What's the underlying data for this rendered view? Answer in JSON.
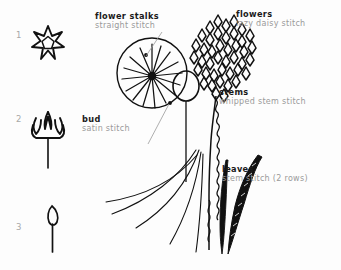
{
  "canvas": {
    "width": 341,
    "height": 270,
    "background": "#fdfdfd",
    "ink": "#111111",
    "heading_color": "#1a1a1a",
    "sub_color": "#9a9a9a",
    "number_color": "#a8a8a8"
  },
  "title": "",
  "steps": [
    {
      "number": "1",
      "name": "star-flower"
    },
    {
      "number": "2",
      "name": "tulip-flower"
    },
    {
      "number": "3",
      "name": "bud-on-stem"
    }
  ],
  "labels": {
    "flower_stalks": {
      "heading": "flower stalks",
      "sub": "straight stitch"
    },
    "flowers": {
      "heading": "flowers",
      "sub": "lazy daisy stitch"
    },
    "stems": {
      "heading": "stems",
      "sub": "whipped stem stitch"
    },
    "bud": {
      "heading": "bud",
      "sub": "satin stitch"
    },
    "leaves": {
      "heading": "leaves",
      "sub": "stem stitch (2 rows)"
    }
  }
}
